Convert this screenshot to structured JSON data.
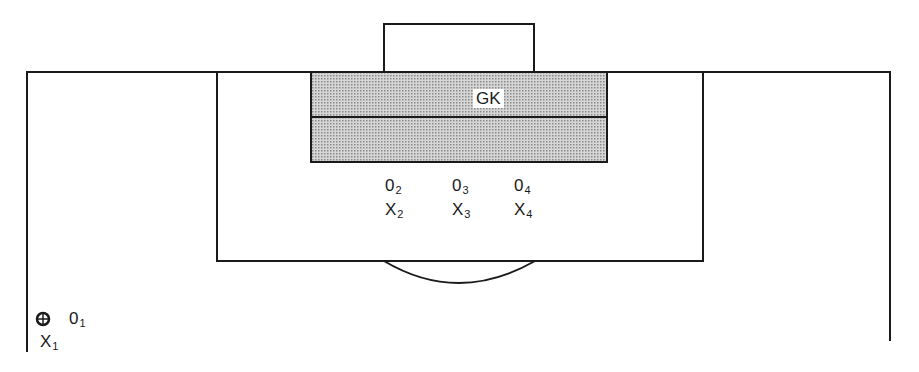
{
  "diagram": {
    "type": "soccer-penalty-area-setup",
    "goalkeeper_label": "GK",
    "colors": {
      "line": "#1a1a1a",
      "shaded_area": "#b8b8b8",
      "background": "#ffffff"
    },
    "players": [
      {
        "id": "O1",
        "letter": "0",
        "sub": "1",
        "team": "O"
      },
      {
        "id": "X1",
        "letter": "X",
        "sub": "1",
        "team": "X",
        "has_ball": true
      },
      {
        "id": "O2",
        "letter": "0",
        "sub": "2",
        "team": "O"
      },
      {
        "id": "O3",
        "letter": "0",
        "sub": "3",
        "team": "O"
      },
      {
        "id": "O4",
        "letter": "0",
        "sub": "4",
        "team": "O"
      },
      {
        "id": "X2",
        "letter": "X",
        "sub": "2",
        "team": "X"
      },
      {
        "id": "X3",
        "letter": "X",
        "sub": "3",
        "team": "X"
      },
      {
        "id": "X4",
        "letter": "X",
        "sub": "4",
        "team": "X"
      }
    ],
    "ball_icon": "soccer-ball-icon"
  }
}
